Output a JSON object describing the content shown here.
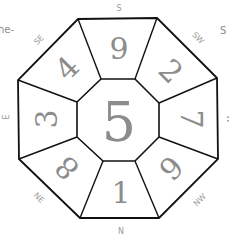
{
  "diagram": {
    "title_fragment_left": "he-",
    "title_fragment_right": "S",
    "center_number": "5",
    "sectors": [
      {
        "direction": "S",
        "number": "9"
      },
      {
        "direction": "SW",
        "number": "2"
      },
      {
        "direction": "W",
        "number": "7"
      },
      {
        "direction": "NW",
        "number": "6"
      },
      {
        "direction": "N",
        "number": "1"
      },
      {
        "direction": "NE",
        "number": "8"
      },
      {
        "direction": "E",
        "number": "3"
      },
      {
        "direction": "SE",
        "number": "4"
      }
    ]
  }
}
